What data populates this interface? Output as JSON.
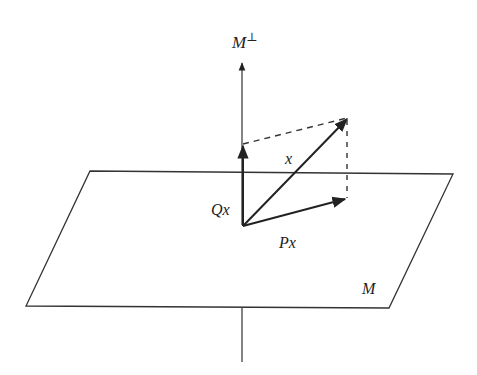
{
  "diagram": {
    "labels": {
      "m_perp": "M",
      "m_perp_sup": "⊥",
      "vector_x": "x",
      "projection_qx": "Qx",
      "projection_px": "Px",
      "plane": "M"
    },
    "colors": {
      "stroke": "#333333",
      "text": "#222222",
      "background": "#ffffff"
    },
    "elements": [
      "perpendicular axis M⊥",
      "plane M (parallelogram)",
      "vector x",
      "projection Px onto M",
      "projection Qx onto M⊥",
      "dashed completion lines"
    ]
  }
}
